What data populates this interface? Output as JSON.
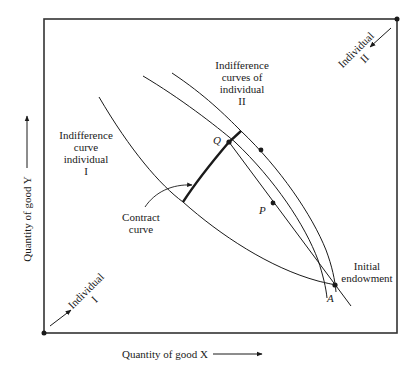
{
  "diagram": {
    "type": "edgeworth-box",
    "colors": {
      "ink": "#1a1a1a",
      "frame": "#333333",
      "background": "#ffffff"
    },
    "axes": {
      "x_label": "Quantity of good X",
      "y_label": "Quantity of good Y"
    },
    "origins": {
      "individual_1": {
        "line1": "Individual",
        "line2": "I"
      },
      "individual_2": {
        "line1": "Individual",
        "line2": "II"
      }
    },
    "labels": {
      "ic_individual_1": [
        "Indifference",
        "curve",
        "individual",
        "I"
      ],
      "ic_individual_2": [
        "Indifference",
        "curves of",
        "individual",
        "II"
      ],
      "contract_curve": [
        "Contract",
        "curve"
      ],
      "initial_endowment": [
        "Initial",
        "endowment"
      ]
    },
    "points": {
      "Q": "Q",
      "P": "P",
      "A": "A"
    }
  }
}
